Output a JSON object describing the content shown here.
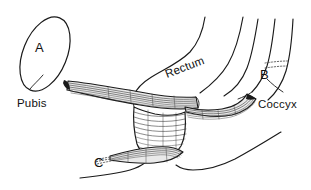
{
  "figure": {
    "canvas": {
      "width": 311,
      "height": 190
    },
    "background_color": "#ffffff",
    "line_color": "#1a1a1a",
    "shading_color": "#e9e9e9"
  },
  "labels": {
    "pubis": "Pubis",
    "rectum": "Rectum",
    "coccyx": "Coccyx",
    "marker_a": "A",
    "marker_b": "B",
    "marker_c": "C"
  },
  "structures": [
    {
      "marker": "A",
      "name": "Pubis",
      "kind": "bone",
      "shape": "ellipse"
    },
    {
      "marker": "B",
      "name": "Coccyx",
      "kind": "bone",
      "shape": "curved-column"
    },
    {
      "marker": "C",
      "name": "unlabeled-muscle-band",
      "kind": "muscle",
      "shape": "striated-band"
    },
    {
      "marker": "",
      "name": "Rectum",
      "kind": "viscus",
      "shape": "tube"
    }
  ],
  "icons": {
    "pubis_marker": "letter-a-marker",
    "coccyx_marker": "letter-b-marker",
    "lower_band_marker": "letter-c-marker"
  }
}
